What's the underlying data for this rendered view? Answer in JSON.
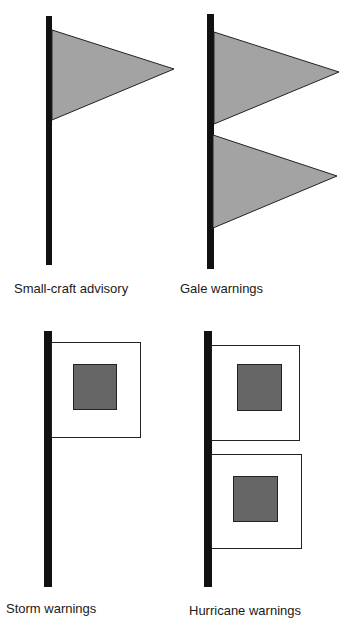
{
  "colors": {
    "pole": "#111111",
    "pennant_fill": "#a3a3a3",
    "square_flag_fill": "#ffffff",
    "inner_square_fill": "#666666",
    "outline": "#222222"
  },
  "signals": [
    {
      "label": "Small-craft advisory",
      "flag_type": "pennant",
      "count": 1
    },
    {
      "label": "Gale warnings",
      "flag_type": "pennant",
      "count": 2
    },
    {
      "label": "Storm warnings",
      "flag_type": "square-with-center",
      "count": 1
    },
    {
      "label": "Hurricane warnings",
      "flag_type": "square-with-center",
      "count": 2
    }
  ]
}
